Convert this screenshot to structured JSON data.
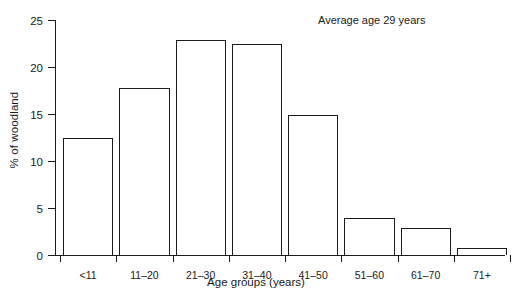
{
  "chart_data": {
    "type": "bar",
    "title": "",
    "subtitle": "",
    "xlabel": "Age groups (years)",
    "ylabel": "% of woodland",
    "categories": [
      "<11",
      "11–20",
      "21–30",
      "31–40",
      "41–50",
      "51–60",
      "61–70",
      "71+"
    ],
    "values": [
      12.5,
      17.8,
      22.9,
      22.4,
      14.9,
      3.9,
      2.9,
      0.7
    ],
    "ylim": [
      0,
      25
    ],
    "yticks": [
      0,
      5,
      10,
      15,
      20,
      25
    ],
    "ytick_labels": [
      "0",
      "5",
      "10",
      "15",
      "20",
      "25"
    ],
    "grid": false,
    "legend": false,
    "legend_position": "none",
    "annotations": [
      {
        "text": "Average age 29 years",
        "position": "top-right"
      }
    ],
    "bar_style": {
      "fill": "#ffffff",
      "edge": "#1a1a1a"
    }
  }
}
